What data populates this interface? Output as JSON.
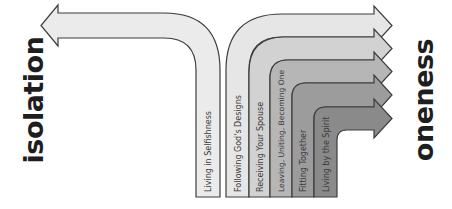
{
  "left_label": "isolation",
  "right_label": "oneness",
  "left_path": {
    "label": "Living in Selfishness",
    "fill": "#ebebeb",
    "direction": "left"
  },
  "right_paths": [
    {
      "label": "Following God's Designs",
      "fill": "#e6e6e6"
    },
    {
      "label": "Receiving Your Spouse",
      "fill": "#d2d2d2"
    },
    {
      "label": "Leaving, Uniting, Becoming One",
      "fill": "#b6b6b6"
    },
    {
      "label": "Fitting Together",
      "fill": "#9c9c9c"
    },
    {
      "label": "Living by the Spirit",
      "fill": "#8a8a8a"
    }
  ],
  "colors": {
    "stroke": "#3c3c3c",
    "text": "#1e1e1e",
    "background": "#ffffff"
  }
}
